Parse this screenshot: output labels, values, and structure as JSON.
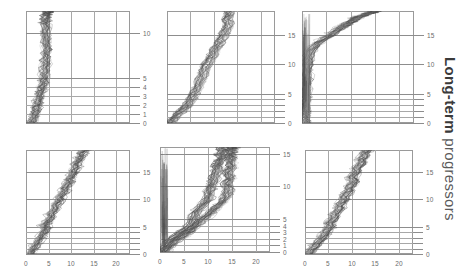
{
  "figure": {
    "side_label_bold": "Long-term",
    "side_label_regular": " progressors",
    "panel_count": 6,
    "grid_color": "#a8a8a8",
    "trace_color": "#4d4d4d",
    "trace_color_light": "#9e9e9e",
    "background": "#ffffff"
  },
  "chart_data": {
    "type": "line",
    "title": "",
    "subtitle": "",
    "xlabel": "",
    "ylabel": "",
    "legend_position": "none",
    "grid": true,
    "panel_layout": {
      "rows": 2,
      "cols": 3
    },
    "annotations": [
      "Long-term progressors"
    ],
    "panels": [
      {
        "id": "panel-r1c1",
        "row": 1,
        "col": 1,
        "xlim": [
          0,
          23
        ],
        "ylim": [
          0,
          12.5
        ],
        "xticks": [
          0,
          5,
          10,
          15,
          20
        ],
        "xticklabels": [],
        "yticks": [
          0,
          1,
          2,
          3,
          4,
          5,
          10
        ],
        "yticklabels": [
          "0",
          "1",
          "2",
          "3",
          "4",
          "5",
          "10"
        ],
        "series": [
          {
            "name": "band-center",
            "x": [
              1.3,
              1.5,
              1.7,
              1.9,
              2.0,
              2.2,
              2.4,
              2.3,
              2.6,
              2.8,
              2.7,
              3.0,
              3.2,
              3.1,
              3.4,
              3.6,
              3.5,
              3.8,
              4.0,
              3.9,
              4.2,
              4.0,
              4.3,
              4.1,
              4.5,
              4.3,
              4.6,
              4.4,
              4.8,
              4.6,
              4.4,
              4.7,
              4.5,
              4.3,
              4.6,
              4.4,
              4.2,
              4.5,
              4.3,
              4.6,
              4.4,
              4.7,
              4.5,
              4.8,
              5.0,
              4.8,
              5.1,
              4.9,
              5.2
            ],
            "y": [
              0.0,
              0.25,
              0.5,
              0.75,
              1.0,
              1.25,
              1.5,
              1.75,
              2.0,
              2.25,
              2.5,
              2.75,
              3.0,
              3.25,
              3.5,
              3.75,
              4.0,
              4.25,
              4.5,
              4.75,
              5.0,
              5.4,
              5.8,
              6.2,
              6.6,
              7.0,
              7.4,
              7.8,
              8.2,
              8.6,
              9.0,
              9.4,
              9.8,
              10.2,
              10.6,
              11.0,
              11.2,
              11.4,
              11.6,
              11.8,
              12.0,
              12.1,
              12.2,
              12.3,
              12.35,
              12.4,
              12.45,
              12.48,
              12.5
            ]
          }
        ]
      },
      {
        "id": "panel-r1c2",
        "row": 1,
        "col": 2,
        "xlim": [
          0,
          23
        ],
        "ylim": [
          0,
          19
        ],
        "xticks": [
          0,
          5,
          10,
          15,
          20
        ],
        "xticklabels": [],
        "yticks": [
          0,
          1,
          2,
          3,
          4,
          5,
          10,
          15
        ],
        "yticklabels": [
          "0",
          "",
          "",
          "",
          "",
          "5",
          "10",
          "15"
        ],
        "series": [
          {
            "name": "band-center",
            "x": [
              0.8,
              1.1,
              1.4,
              1.7,
              2.0,
              2.4,
              2.8,
              3.2,
              3.6,
              4.0,
              4.4,
              4.7,
              5.0,
              5.3,
              5.6,
              5.9,
              6.2,
              6.5,
              6.8,
              7.0,
              7.2,
              7.5,
              7.8,
              8.0,
              8.3,
              8.6,
              8.9,
              9.2,
              9.5,
              9.8,
              10.0,
              10.3,
              10.6,
              10.9,
              11.2,
              11.5,
              11.8,
              12.0,
              12.3,
              12.5,
              12.7,
              12.9,
              13.1,
              13.0,
              12.8,
              13.0,
              13.2,
              13.4,
              13.3
            ],
            "y": [
              0.0,
              0.3,
              0.6,
              0.9,
              1.2,
              1.5,
              1.8,
              2.1,
              2.4,
              2.7,
              3.0,
              3.4,
              3.8,
              4.2,
              4.6,
              5.0,
              5.5,
              6.0,
              6.5,
              7.0,
              7.5,
              8.0,
              8.5,
              9.0,
              9.5,
              10.0,
              10.4,
              10.8,
              11.2,
              11.6,
              12.0,
              12.4,
              12.8,
              13.2,
              13.6,
              14.0,
              14.4,
              14.8,
              15.2,
              15.6,
              16.0,
              16.4,
              16.8,
              17.2,
              17.6,
              18.0,
              18.3,
              18.6,
              19.0
            ]
          }
        ]
      },
      {
        "id": "panel-r1c3",
        "row": 1,
        "col": 3,
        "xlim": [
          0,
          23
        ],
        "ylim": [
          0,
          19
        ],
        "xticks": [
          0,
          5,
          10,
          15,
          20
        ],
        "xticklabels": [],
        "yticks": [
          0,
          1,
          2,
          3,
          4,
          5,
          10,
          15
        ],
        "yticklabels": [
          "0",
          "",
          "",
          "",
          "",
          "5",
          "10",
          "15"
        ],
        "series": [
          {
            "name": "band-center",
            "x": [
              0.6,
              0.6,
              0.6,
              0.6,
              0.6,
              0.7,
              0.7,
              0.7,
              0.7,
              0.8,
              0.8,
              0.8,
              0.9,
              0.9,
              1.0,
              1.0,
              1.1,
              1.2,
              1.4,
              1.8,
              2.4,
              3.2,
              4.2,
              5.0,
              5.8,
              6.4,
              7.0,
              7.5,
              8.0,
              8.4,
              8.8,
              9.2,
              9.6,
              10.0,
              10.4,
              10.8,
              11.2,
              11.6,
              12.0,
              12.4,
              12.8,
              13.2,
              13.6,
              14.0,
              14.3,
              14.6,
              14.8,
              15.0,
              15.2
            ],
            "y": [
              0.0,
              0.4,
              0.8,
              1.2,
              1.6,
              2.0,
              2.6,
              3.2,
              3.8,
              4.4,
              5.0,
              5.8,
              6.6,
              7.4,
              8.2,
              9.0,
              9.8,
              10.6,
              11.4,
              12.2,
              13.0,
              13.6,
              14.1,
              14.5,
              14.9,
              15.3,
              15.6,
              15.9,
              16.2,
              16.4,
              16.6,
              16.8,
              17.0,
              17.2,
              17.4,
              17.6,
              17.8,
              18.0,
              18.1,
              18.2,
              18.35,
              18.5,
              18.6,
              18.7,
              18.8,
              18.85,
              18.9,
              18.95,
              19.0
            ]
          }
        ]
      },
      {
        "id": "panel-r2c1",
        "row": 2,
        "col": 1,
        "xlim": [
          0,
          23
        ],
        "ylim": [
          0,
          19
        ],
        "xticks": [
          0,
          5,
          10,
          15,
          20
        ],
        "xticklabels": [
          "0",
          "5",
          "10",
          "15",
          "20"
        ],
        "yticks": [
          0,
          1,
          2,
          3,
          4,
          5,
          10,
          15
        ],
        "yticklabels": [
          "0",
          "",
          "",
          "",
          "",
          "5",
          "10",
          "15"
        ],
        "series": [
          {
            "name": "band-center",
            "x": [
              0.9,
              1.2,
              1.5,
              1.8,
              2.1,
              2.4,
              2.7,
              3.0,
              3.3,
              3.6,
              3.9,
              4.1,
              4.3,
              4.0,
              4.4,
              4.8,
              5.2,
              5.6,
              5.4,
              5.8,
              6.2,
              6.6,
              6.4,
              6.8,
              7.2,
              7.6,
              7.4,
              7.8,
              8.2,
              8.6,
              8.4,
              8.8,
              9.2,
              9.6,
              9.4,
              9.8,
              10.2,
              10.6,
              10.4,
              10.8,
              11.2,
              11.0,
              11.4,
              11.8,
              12.0,
              12.4,
              12.2,
              12.6,
              12.8
            ],
            "y": [
              0.0,
              0.4,
              0.8,
              1.2,
              1.6,
              2.0,
              2.4,
              2.8,
              3.2,
              3.6,
              4.0,
              4.4,
              4.8,
              5.2,
              5.6,
              6.0,
              6.4,
              6.8,
              7.2,
              7.6,
              8.0,
              8.4,
              8.8,
              9.2,
              9.6,
              10.0,
              10.4,
              10.8,
              11.2,
              11.6,
              12.0,
              12.4,
              12.8,
              13.2,
              13.6,
              14.0,
              14.4,
              14.8,
              15.2,
              15.6,
              16.0,
              16.4,
              16.8,
              17.2,
              17.6,
              18.0,
              18.4,
              18.7,
              19.0
            ]
          }
        ]
      },
      {
        "id": "panel-r2c2",
        "row": 2,
        "col": 2,
        "xlim": [
          0,
          23
        ],
        "ylim": [
          0,
          16
        ],
        "xticks": [
          0,
          5,
          10,
          15,
          20
        ],
        "xticklabels": [
          "0",
          "5",
          "10",
          "15",
          "20"
        ],
        "yticks": [
          0,
          1,
          2,
          3,
          4,
          5,
          10,
          15
        ],
        "yticklabels": [
          "0",
          "1",
          "2",
          "3",
          "4",
          "5",
          "10",
          "15"
        ],
        "series": [
          {
            "name": "band-left",
            "x": [
              0.5,
              0.7,
              1.0,
              1.4,
              2.0,
              2.6,
              3.4,
              4.2,
              5.0,
              5.8,
              6.4,
              6.8,
              7.0,
              7.2,
              7.4,
              7.6,
              8.0,
              8.6,
              9.2,
              9.6,
              10.0,
              10.2,
              10.4,
              10.5,
              10.6,
              10.8,
              11.0,
              11.2,
              11.4,
              11.6,
              11.8,
              12.0,
              12.2,
              12.1,
              12.0,
              12.2,
              12.4,
              12.6,
              12.8,
              13.0,
              13.2,
              13.0,
              12.8,
              13.0,
              13.2,
              13.4,
              13.2,
              13.0,
              13.2
            ],
            "y": [
              0.0,
              0.4,
              0.8,
              1.2,
              1.6,
              2.0,
              2.4,
              2.8,
              3.2,
              3.6,
              4.0,
              4.4,
              4.8,
              5.2,
              5.6,
              6.0,
              6.4,
              6.8,
              7.2,
              7.6,
              8.0,
              8.4,
              8.8,
              9.2,
              9.6,
              10.0,
              10.4,
              10.8,
              11.2,
              11.6,
              12.0,
              12.4,
              12.8,
              13.0,
              13.2,
              13.4,
              13.6,
              13.8,
              14.0,
              14.2,
              14.4,
              14.6,
              14.8,
              15.0,
              15.2,
              15.4,
              15.6,
              15.8,
              16.0
            ]
          },
          {
            "name": "band-right",
            "x": [
              1.0,
              1.4,
              1.9,
              2.5,
              3.2,
              4.0,
              4.8,
              5.6,
              6.4,
              7.0,
              7.6,
              8.2,
              8.8,
              9.4,
              10.0,
              10.6,
              11.2,
              11.8,
              12.4,
              13.0,
              13.4,
              13.8,
              14.0,
              14.2,
              14.4,
              14.2,
              14.0,
              14.3,
              14.6,
              14.4,
              14.2,
              14.5,
              14.8,
              15.0,
              14.8,
              14.6,
              14.9,
              15.1,
              14.9,
              14.7,
              15.0,
              15.2,
              15.0,
              14.8,
              15.0,
              15.2,
              15.4,
              15.2,
              15.0
            ],
            "y": [
              0.0,
              0.4,
              0.8,
              1.2,
              1.6,
              2.0,
              2.4,
              2.8,
              3.2,
              3.6,
              4.0,
              4.4,
              4.8,
              5.2,
              5.6,
              6.0,
              6.4,
              6.8,
              7.2,
              7.6,
              8.0,
              8.4,
              8.8,
              9.2,
              9.6,
              10.0,
              10.4,
              10.8,
              11.2,
              11.6,
              12.0,
              12.4,
              12.8,
              13.2,
              13.6,
              14.0,
              14.2,
              14.4,
              14.6,
              14.8,
              15.0,
              15.2,
              15.4,
              15.6,
              15.7,
              15.8,
              15.9,
              15.95,
              16.0
            ]
          }
        ]
      },
      {
        "id": "panel-r2c3",
        "row": 2,
        "col": 3,
        "xlim": [
          0,
          23
        ],
        "ylim": [
          0,
          19
        ],
        "xticks": [
          0,
          5,
          10,
          15,
          20
        ],
        "xticklabels": [
          "0",
          "5",
          "10",
          "15",
          "20"
        ],
        "yticks": [
          0,
          1,
          2,
          3,
          4,
          5,
          10,
          15
        ],
        "yticklabels": [
          "0",
          "",
          "",
          "",
          "",
          "5",
          "10",
          "15"
        ],
        "series": [
          {
            "name": "band-center",
            "x": [
              0.8,
              1.1,
              1.5,
              1.9,
              2.3,
              2.7,
              3.1,
              3.5,
              3.9,
              4.3,
              4.6,
              4.9,
              5.2,
              5.5,
              5.3,
              5.7,
              6.1,
              6.5,
              6.3,
              6.7,
              7.1,
              7.5,
              7.3,
              7.7,
              8.1,
              8.5,
              8.3,
              8.7,
              9.1,
              9.5,
              9.3,
              9.7,
              10.1,
              10.5,
              10.3,
              10.0,
              10.4,
              10.8,
              11.2,
              11.0,
              11.4,
              11.8,
              12.2,
              12.0,
              12.4,
              12.8,
              12.6,
              13.0,
              13.2
            ],
            "y": [
              0.0,
              0.4,
              0.8,
              1.2,
              1.6,
              2.0,
              2.4,
              2.8,
              3.2,
              3.6,
              4.0,
              4.4,
              4.8,
              5.2,
              5.6,
              6.0,
              6.4,
              6.8,
              7.2,
              7.6,
              8.0,
              8.4,
              8.8,
              9.2,
              9.6,
              10.0,
              10.4,
              10.8,
              11.2,
              11.6,
              12.0,
              12.4,
              12.8,
              13.2,
              13.6,
              14.0,
              14.4,
              14.8,
              15.2,
              15.6,
              16.0,
              16.4,
              16.8,
              17.2,
              17.6,
              18.0,
              18.4,
              18.7,
              19.0
            ]
          }
        ]
      }
    ]
  }
}
